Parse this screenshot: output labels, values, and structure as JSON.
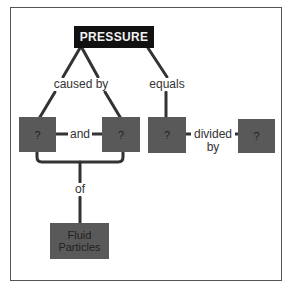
{
  "diagram": {
    "type": "concept-map",
    "root": {
      "label": "PRESSURE"
    },
    "links": {
      "caused_by": "caused by",
      "equals": "equals",
      "and": "and",
      "divided_by_line1": "divided",
      "divided_by_line2": "by",
      "of": "of"
    },
    "nodes": {
      "cause_1": "?",
      "cause_2": "?",
      "numerator": "?",
      "denominator": "?",
      "fluid_line1": "Fluid",
      "fluid_line2": "Particles"
    },
    "colors": {
      "root_fill": "#111111",
      "node_fill": "#595959",
      "line": "#333333",
      "border": "#555555"
    }
  }
}
